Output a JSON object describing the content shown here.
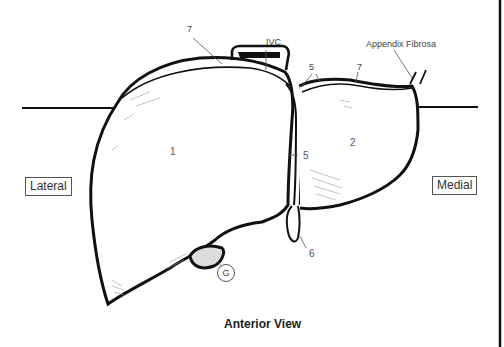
{
  "diagram": {
    "title": "Anterior View",
    "orientation": {
      "left_label": "Lateral",
      "right_label": "Medial"
    },
    "labels": {
      "ligament_top_left": "7",
      "ivc": "IVC",
      "ligament_top_center": "5",
      "ligament_top_right": "7",
      "appendix_fibrosa": "Appendix Fibrosa",
      "right_lobe": "1",
      "left_lobe": "2",
      "ligament_middle": "5",
      "round_ligament": "6",
      "gallbladder": "G"
    },
    "colors": {
      "outline": "#111111",
      "label_text": "#444444",
      "background": "#ffffff"
    }
  }
}
